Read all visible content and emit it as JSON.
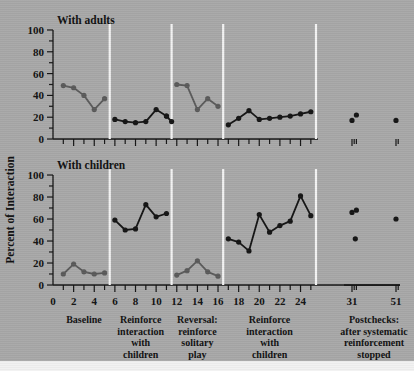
{
  "figure": {
    "background_color": "#a8a8a8",
    "ink_color": "#101010",
    "phase_divider_color": "#f4f4f4",
    "axis_title_y": "Percent of Interaction"
  },
  "chart_data": {
    "type": "line",
    "title": "Percent of Interaction",
    "xlabel": "",
    "ylabel": "Percent of Interaction",
    "xlim": [
      0,
      54
    ],
    "ylim": [
      0,
      100
    ],
    "grid": false,
    "legend": "none",
    "xticks_major": [
      0,
      2,
      4,
      6,
      8,
      10,
      12,
      14,
      16,
      18,
      20,
      22,
      24,
      31,
      51
    ],
    "xticks_minor": [
      1,
      3,
      5,
      7,
      9,
      11,
      13,
      15,
      17,
      19,
      21,
      23,
      25,
      32,
      33,
      52
    ],
    "yticks_major": [
      0,
      20,
      40,
      60,
      80,
      100
    ],
    "yticks_minor": [
      10,
      30,
      50,
      70,
      90
    ],
    "phase_boundaries": [
      5.5,
      11.5,
      16.5,
      25.5
    ],
    "phases": [
      {
        "name": "Baseline",
        "lines": [
          "Baseline"
        ],
        "x_center": 3
      },
      {
        "name": "Reinforce interaction with children",
        "lines": [
          "Reinforce",
          "interaction",
          "with",
          "children"
        ],
        "x_center": 8.5
      },
      {
        "name": "Reversal: reinforce solitary play",
        "lines": [
          "Reversal:",
          "reinforce",
          "solitary",
          "play"
        ],
        "x_center": 14
      },
      {
        "name": "Reinforce interaction with children",
        "lines": [
          "Reinforce",
          "interaction",
          "with",
          "children"
        ],
        "x_center": 21
      },
      {
        "name": "Postchecks: after systematic reinforcement stopped",
        "lines": [
          "Postchecks:",
          "after systematic",
          "reinforcement",
          "stopped"
        ],
        "x_center": 41
      }
    ],
    "panels": [
      {
        "id": "with-adults",
        "title": "With adults",
        "series": [
          {
            "name": "Baseline (with adults)",
            "color": "#5a5a5a",
            "connected": true,
            "x": [
              1,
              2,
              3,
              4,
              5
            ],
            "y": [
              49,
              47,
              40,
              27,
              37
            ]
          },
          {
            "name": "Reinforce interaction with children (with adults)",
            "color": "#141414",
            "connected": true,
            "x": [
              6,
              7,
              8,
              9,
              10,
              11
            ],
            "y": [
              18,
              16,
              15,
              16,
              27,
              21
            ]
          },
          {
            "name": "Reinforce interaction with children cont. (with adults)",
            "color": "#141414",
            "connected": true,
            "x": [
              11,
              11.5
            ],
            "y": [
              21,
              16
            ]
          },
          {
            "name": "Reversal: reinforce solitary play (with adults)",
            "color": "#5a5a5a",
            "connected": true,
            "x": [
              12,
              13,
              14,
              15,
              16
            ],
            "y": [
              50,
              49,
              27,
              37,
              30
            ]
          },
          {
            "name": "Reinforce interaction with children II (with adults)",
            "color": "#141414",
            "connected": true,
            "x": [
              17,
              18,
              19,
              20,
              21,
              22,
              23,
              24,
              25
            ],
            "y": [
              13,
              19,
              26,
              18,
              19,
              20,
              21,
              23,
              25
            ]
          },
          {
            "name": "Postchecks (with adults)",
            "color": "#141414",
            "connected": false,
            "x": [
              31,
              33,
              51
            ],
            "y": [
              17,
              22,
              17
            ]
          }
        ]
      },
      {
        "id": "with-children",
        "title": "With children",
        "series": [
          {
            "name": "Baseline (with children)",
            "color": "#5a5a5a",
            "connected": true,
            "x": [
              1,
              2,
              3,
              4,
              5
            ],
            "y": [
              10,
              19,
              12,
              10,
              11
            ]
          },
          {
            "name": "Reinforce interaction with children (with children)",
            "color": "#141414",
            "connected": true,
            "x": [
              6,
              7,
              8,
              9,
              10,
              11
            ],
            "y": [
              59,
              50,
              51,
              73,
              62,
              65
            ]
          },
          {
            "name": "Reversal: reinforce solitary play (with children)",
            "color": "#5a5a5a",
            "connected": true,
            "x": [
              12,
              13,
              14,
              15,
              16
            ],
            "y": [
              9,
              13,
              22,
              12,
              8
            ]
          },
          {
            "name": "Reinforce interaction with children II (with children)",
            "color": "#141414",
            "connected": true,
            "x": [
              17,
              18,
              19,
              20,
              21,
              22,
              23,
              24,
              25
            ],
            "y": [
              42,
              39,
              31,
              64,
              48,
              54,
              58,
              81,
              63
            ]
          },
          {
            "name": "Postchecks (with children)",
            "color": "#141414",
            "connected": false,
            "x": [
              31,
              32.5,
              33,
              51
            ],
            "y": [
              66,
              42,
              68,
              60
            ]
          }
        ]
      }
    ]
  }
}
